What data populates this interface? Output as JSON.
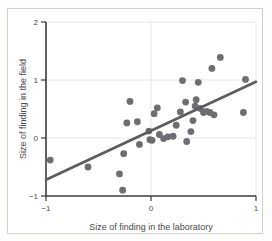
{
  "chart_data": {
    "type": "scatter",
    "title": "",
    "xlabel": "Size of finding in the laboratory",
    "ylabel": "Size of finding in the field",
    "xlim": [
      -1,
      1
    ],
    "ylim": [
      -1,
      2
    ],
    "xticks": [
      -1,
      0,
      1
    ],
    "xtick_labels": [
      "−1",
      "0",
      "1"
    ],
    "yticks": [
      -1,
      0,
      1,
      2
    ],
    "ytick_labels": [
      "−1",
      "0",
      "1",
      "2"
    ],
    "grid": true,
    "legend": "none",
    "marker_color": "#6e6e72",
    "line_color": "#5c5c60",
    "points": [
      [
        -0.96,
        -0.38
      ],
      [
        -0.6,
        -0.5
      ],
      [
        -0.3,
        -0.62
      ],
      [
        -0.27,
        -0.9
      ],
      [
        -0.26,
        -0.27
      ],
      [
        -0.23,
        0.26
      ],
      [
        -0.2,
        0.63
      ],
      [
        -0.13,
        0.28
      ],
      [
        -0.11,
        -0.11
      ],
      [
        -0.02,
        0.12
      ],
      [
        -0.01,
        -0.03
      ],
      [
        0.01,
        -0.04
      ],
      [
        0.03,
        0.42
      ],
      [
        0.06,
        0.52
      ],
      [
        0.08,
        0.06
      ],
      [
        0.12,
        -0.01
      ],
      [
        0.16,
        0.02
      ],
      [
        0.21,
        0.03
      ],
      [
        0.24,
        0.22
      ],
      [
        0.28,
        0.45
      ],
      [
        0.3,
        0.99
      ],
      [
        0.33,
        0.62
      ],
      [
        0.34,
        -0.06
      ],
      [
        0.38,
        0.11
      ],
      [
        0.4,
        0.3
      ],
      [
        0.42,
        0.55
      ],
      [
        0.43,
        0.66
      ],
      [
        0.45,
        0.96
      ],
      [
        0.47,
        0.51
      ],
      [
        0.5,
        0.44
      ],
      [
        0.53,
        0.46
      ],
      [
        0.56,
        0.44
      ],
      [
        0.58,
        1.2
      ],
      [
        0.6,
        0.4
      ],
      [
        0.66,
        1.39
      ],
      [
        0.88,
        0.44
      ],
      [
        0.9,
        1.01
      ]
    ],
    "fit_line": {
      "x_start": -1,
      "y_start": -0.72,
      "x_end": 1,
      "y_end": 0.97
    }
  }
}
